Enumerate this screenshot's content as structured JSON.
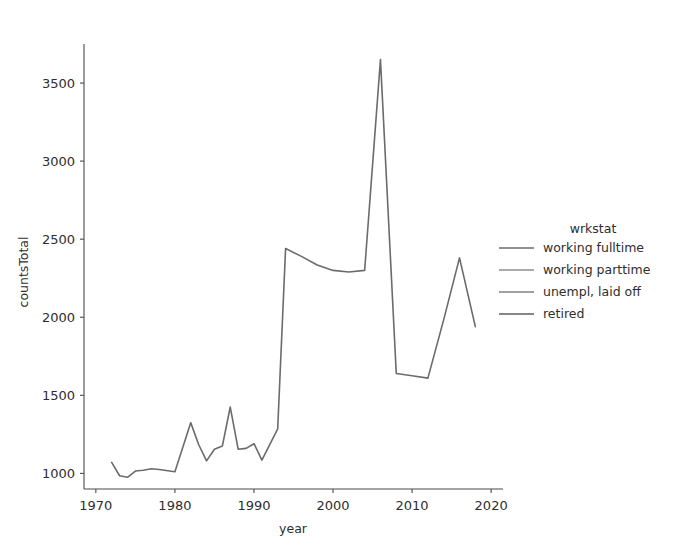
{
  "figure": {
    "title_visible_text": "",
    "background": "#ffffff"
  },
  "chart_data": {
    "type": "line",
    "title": "",
    "xlabel": "year",
    "ylabel": "countsTotal",
    "xlim": [
      1968.5,
      2021.5
    ],
    "ylim": [
      900,
      3750
    ],
    "xticks": [
      1970,
      1980,
      1990,
      2000,
      2010,
      2020
    ],
    "yticks": [
      1000,
      1500,
      2000,
      2500,
      3000,
      3500
    ],
    "grid": false,
    "legend": {
      "title": "wrkstat",
      "position": "right",
      "entries": [
        {
          "label": "working fulltime",
          "color": "#6e6e6e"
        },
        {
          "label": "working parttime",
          "color": "#8f8f8f"
        },
        {
          "label": "unempl, laid off",
          "color": "#828282"
        },
        {
          "label": "retired",
          "color": "#5e5e5e"
        }
      ]
    },
    "line_color": "#6b6b6b",
    "line_width": 1.6,
    "x": [
      1972,
      1973,
      1974,
      1975,
      1976,
      1977,
      1978,
      1980,
      1982,
      1983,
      1984,
      1985,
      1986,
      1987,
      1988,
      1989,
      1990,
      1991,
      1993,
      1994,
      1996,
      1998,
      2000,
      2002,
      2004,
      2006,
      2008,
      2010,
      2012,
      2014,
      2016,
      2018
    ],
    "series": [
      {
        "name": "countsTotal",
        "values": [
          1070,
          985,
          975,
          1015,
          1020,
          1030,
          1025,
          1010,
          1325,
          1185,
          1080,
          1155,
          1175,
          1425,
          1155,
          1160,
          1190,
          1085,
          1285,
          2440,
          2390,
          2335,
          2300,
          2290,
          2300,
          3650,
          1640,
          1625,
          1610,
          1985,
          2380,
          1940
        ]
      }
    ]
  },
  "axes": {
    "y_tick_labels": [
      "1000",
      "1500",
      "2000",
      "2500",
      "3000",
      "3500"
    ],
    "x_tick_labels": [
      "1970",
      "1980",
      "1990",
      "2000",
      "2010",
      "2020"
    ],
    "y_axis_label": "countsTotal",
    "x_axis_label": "year"
  }
}
